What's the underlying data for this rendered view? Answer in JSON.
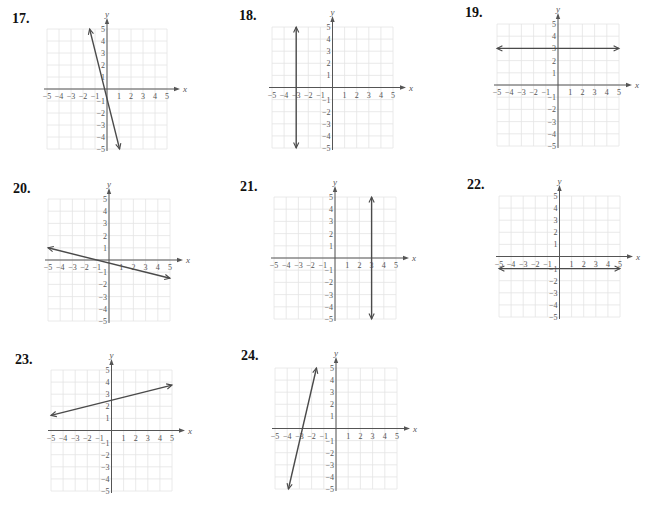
{
  "chart_data": [
    {
      "type": "line",
      "number": "17.",
      "xlabel": "x",
      "ylabel": "y",
      "xlim": [
        -5,
        5
      ],
      "ylim": [
        -5,
        5
      ],
      "x_ticks": [
        "-5",
        "-4",
        "-3",
        "-2",
        "-1",
        "1",
        "2",
        "3",
        "4",
        "5"
      ],
      "y_ticks": [
        "5",
        "4",
        "3",
        "2",
        "1",
        "-1",
        "-2",
        "-3",
        "-4",
        "-5"
      ],
      "grid": true,
      "line": {
        "from": [
          -1.45,
          5
        ],
        "to": [
          1.05,
          -5
        ],
        "equation": "y = -4x - 1"
      }
    },
    {
      "type": "line",
      "number": "18.",
      "xlabel": "x",
      "ylabel": "y",
      "xlim": [
        -5,
        5
      ],
      "ylim": [
        -5,
        5
      ],
      "x_ticks": [
        "-5",
        "-4",
        "-3",
        "-2",
        "-1",
        "1",
        "2",
        "3",
        "4",
        "5"
      ],
      "y_ticks": [
        "5",
        "4",
        "3",
        "2",
        "1",
        "-1",
        "-2",
        "-3",
        "-4",
        "-5"
      ],
      "grid": true,
      "line": {
        "from": [
          -3,
          5
        ],
        "to": [
          -3,
          -5
        ],
        "equation": "x = -3"
      }
    },
    {
      "type": "line",
      "number": "19.",
      "xlabel": "x",
      "ylabel": "y",
      "xlim": [
        -5,
        5
      ],
      "ylim": [
        -5,
        5
      ],
      "x_ticks": [
        "-5",
        "-4",
        "-3",
        "-2",
        "-1",
        "1",
        "2",
        "3",
        "4",
        "5"
      ],
      "y_ticks": [
        "5",
        "4",
        "3",
        "2",
        "1",
        "-1",
        "-2",
        "-3",
        "-4",
        "-5"
      ],
      "grid": true,
      "line": {
        "from": [
          -5,
          3
        ],
        "to": [
          5,
          3
        ],
        "equation": "y = 3"
      }
    },
    {
      "type": "line",
      "number": "20.",
      "xlabel": "x",
      "ylabel": "y",
      "xlim": [
        -5,
        5
      ],
      "ylim": [
        -5,
        5
      ],
      "x_ticks": [
        "-5",
        "-4",
        "-3",
        "-2",
        "-1",
        "1",
        "2",
        "3",
        "4",
        "5"
      ],
      "y_ticks": [
        "5",
        "4",
        "3",
        "2",
        "1",
        "-1",
        "-2",
        "-3",
        "-4",
        "-5"
      ],
      "grid": true,
      "line": {
        "from": [
          -5,
          1
        ],
        "to": [
          5,
          -1.5
        ],
        "equation": "y = -0.25x - 0.25"
      }
    },
    {
      "type": "line",
      "number": "21.",
      "xlabel": "x",
      "ylabel": "y",
      "xlim": [
        -5,
        5
      ],
      "ylim": [
        -5,
        5
      ],
      "x_ticks": [
        "-5",
        "-4",
        "-3",
        "-2",
        "-1",
        "1",
        "2",
        "3",
        "4",
        "5"
      ],
      "y_ticks": [
        "5",
        "4",
        "3",
        "2",
        "1",
        "-1",
        "-2",
        "-3",
        "-4",
        "-5"
      ],
      "grid": true,
      "line": {
        "from": [
          3,
          5
        ],
        "to": [
          3,
          -5
        ],
        "equation": "x = 3"
      }
    },
    {
      "type": "line",
      "number": "22.",
      "xlabel": "x",
      "ylabel": "y",
      "xlim": [
        -5,
        5
      ],
      "ylim": [
        -5,
        5
      ],
      "x_ticks": [
        "-5",
        "-4",
        "-3",
        "-2",
        "-1",
        "1",
        "2",
        "3",
        "4",
        "5"
      ],
      "y_ticks": [
        "5",
        "4",
        "3",
        "2",
        "1",
        "-1",
        "-2",
        "-3",
        "-4",
        "-5"
      ],
      "grid": true,
      "line": {
        "from": [
          -5,
          -1
        ],
        "to": [
          5,
          -1
        ],
        "equation": "y = -1"
      }
    },
    {
      "type": "line",
      "number": "23.",
      "xlabel": "x",
      "ylabel": "y",
      "xlim": [
        -5,
        5
      ],
      "ylim": [
        -5,
        5
      ],
      "x_ticks": [
        "-5",
        "-4",
        "-3",
        "-2",
        "-1",
        "1",
        "2",
        "3",
        "4",
        "5"
      ],
      "y_ticks": [
        "5",
        "4",
        "3",
        "2",
        "1",
        "-1",
        "-2",
        "-3",
        "-4",
        "-5"
      ],
      "grid": true,
      "line": {
        "from": [
          -5,
          1.25
        ],
        "to": [
          5,
          3.75
        ],
        "equation": "y = 0.25x + 2.5"
      }
    },
    {
      "type": "line",
      "number": "24.",
      "xlabel": "x",
      "ylabel": "y",
      "xlim": [
        -5,
        5
      ],
      "ylim": [
        -5,
        5
      ],
      "x_ticks": [
        "-5",
        "-4",
        "-3",
        "-2",
        "-1",
        "1",
        "2",
        "3",
        "4",
        "5"
      ],
      "y_ticks": [
        "5",
        "4",
        "3",
        "2",
        "1",
        "-1",
        "-2",
        "-3",
        "-4",
        "-5"
      ],
      "grid": true,
      "line": {
        "from": [
          -3.9,
          -5
        ],
        "to": [
          -1.6,
          5
        ],
        "equation": "y ≈ 4.35x + 12"
      }
    }
  ],
  "colors": {
    "grid": "#e4e4e4",
    "axis": "#555555",
    "line": "#4a4a4a",
    "label": "#111111"
  }
}
